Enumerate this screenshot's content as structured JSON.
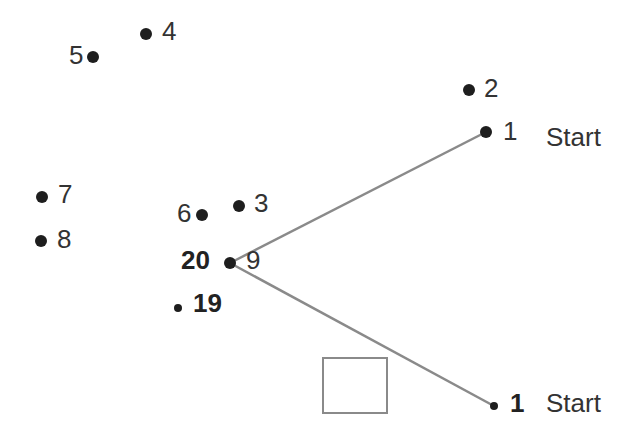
{
  "diagram": {
    "type": "connect-the-dots",
    "line_color": "#8a8a8a",
    "dot_color": "#1e1e1e",
    "points": [
      {
        "id": "p1",
        "label": "1",
        "x": 486,
        "y": 132,
        "r": 6,
        "label_x": 503,
        "label_y": 118,
        "bold": false
      },
      {
        "id": "p2",
        "label": "2",
        "x": 469,
        "y": 90,
        "r": 6,
        "label_x": 484,
        "label_y": 75,
        "bold": false
      },
      {
        "id": "p3",
        "label": "3",
        "x": 239,
        "y": 206,
        "r": 6,
        "label_x": 254,
        "label_y": 190,
        "bold": false
      },
      {
        "id": "p4",
        "label": "4",
        "x": 146,
        "y": 34,
        "r": 6,
        "label_x": 162,
        "label_y": 18,
        "bold": false
      },
      {
        "id": "p5",
        "label": "5",
        "x": 93,
        "y": 57,
        "r": 6,
        "label_x": 69,
        "label_y": 42,
        "bold": false
      },
      {
        "id": "p6",
        "label": "6",
        "x": 202,
        "y": 215,
        "r": 6,
        "label_x": 177,
        "label_y": 200,
        "bold": false
      },
      {
        "id": "p7",
        "label": "7",
        "x": 42,
        "y": 197,
        "r": 6,
        "label_x": 58,
        "label_y": 181,
        "bold": false
      },
      {
        "id": "p8",
        "label": "8",
        "x": 41,
        "y": 241,
        "r": 6,
        "label_x": 57,
        "label_y": 226,
        "bold": false
      },
      {
        "id": "p9",
        "label": "9",
        "x": 230,
        "y": 263,
        "r": 6,
        "label_x": 246,
        "label_y": 247,
        "bold": false
      },
      {
        "id": "p20",
        "label": "20",
        "x": 230,
        "y": 263,
        "r": 0,
        "label_x": 181,
        "label_y": 247,
        "bold": true
      },
      {
        "id": "p19",
        "label": "19",
        "x": 178,
        "y": 308,
        "r": 4,
        "label_x": 193,
        "label_y": 290,
        "bold": true
      },
      {
        "id": "p1b",
        "label": "1",
        "x": 494,
        "y": 406,
        "r": 4,
        "label_x": 510,
        "label_y": 390,
        "bold": true
      }
    ],
    "start_labels": [
      {
        "text": "Start",
        "x": 546,
        "y": 124
      },
      {
        "text": "Start",
        "x": 546,
        "y": 390
      }
    ],
    "lines": [
      {
        "x1": 230,
        "y1": 263,
        "x2": 486,
        "y2": 132
      },
      {
        "x1": 230,
        "y1": 263,
        "x2": 494,
        "y2": 406
      }
    ],
    "box": {
      "x": 322,
      "y": 357,
      "width": 66,
      "height": 57
    }
  }
}
